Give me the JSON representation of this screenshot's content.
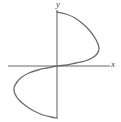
{
  "figure": {
    "width": 121,
    "height": 122,
    "background_color": "#ffffff"
  },
  "labels": {
    "x_axis": "x",
    "y_axis": "y"
  },
  "chart_data": {
    "type": "line",
    "title": "",
    "subtitle": "",
    "xlabel": "x",
    "ylabel": "y",
    "grid": false,
    "legend": null,
    "axes": {
      "x_axis": {
        "orientation": "horizontal",
        "color": "#9a9a9a",
        "stroke_width": 1.6,
        "pixel_y": 66,
        "pixel_x_start": 8,
        "pixel_x_end": 110,
        "arrow": false,
        "ticks": [],
        "tick_labels": []
      },
      "y_axis": {
        "orientation": "vertical",
        "color": "#9a9a9a",
        "stroke_width": 1.6,
        "pixel_x": 57,
        "pixel_y_start": 10,
        "pixel_y_end": 118,
        "arrow": false,
        "ticks": [],
        "tick_labels": []
      }
    },
    "origin_pixel": [
      57,
      66
    ],
    "curve": {
      "name": "cubic-curve",
      "color": "#6b6b6b",
      "stroke_width": 1.3,
      "closed": false,
      "path_points_pixel": [
        [
          57,
          12
        ],
        [
          66,
          14
        ],
        [
          75,
          18
        ],
        [
          83,
          24
        ],
        [
          90,
          31
        ],
        [
          95,
          38
        ],
        [
          98,
          44
        ],
        [
          99,
          49
        ],
        [
          97,
          54
        ],
        [
          92,
          58
        ],
        [
          85,
          61
        ],
        [
          76,
          63
        ],
        [
          67,
          65
        ],
        [
          57,
          66
        ],
        [
          47,
          68
        ],
        [
          38,
          70
        ],
        [
          29,
          73
        ],
        [
          22,
          77
        ],
        [
          17,
          82
        ],
        [
          14,
          88
        ],
        [
          15,
          94
        ],
        [
          19,
          100
        ],
        [
          26,
          106
        ],
        [
          34,
          111
        ],
        [
          43,
          115
        ],
        [
          51,
          117
        ],
        [
          57,
          118
        ]
      ],
      "extrema_pixel": {
        "rightmost": [
          99,
          47
        ],
        "leftmost": [
          14,
          88
        ]
      },
      "endpoints_pixel": {
        "top": [
          57,
          12
        ],
        "bottom": [
          57,
          118
        ]
      }
    }
  }
}
